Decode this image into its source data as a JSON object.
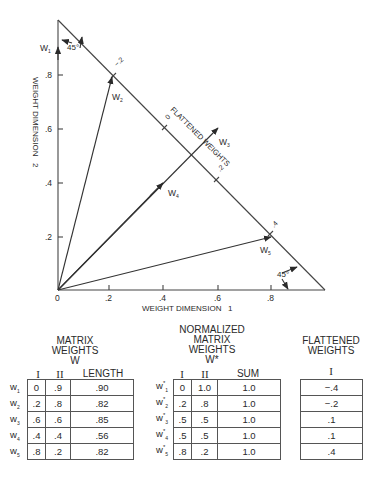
{
  "diagram": {
    "x_axis_label": "WEIGHT DIMENSION   1",
    "y_axis_label": "WEIGHT DIMENSION   2",
    "x_ticks": [
      "0",
      ".2",
      ".4",
      ".6",
      ".8"
    ],
    "y_ticks": [
      ".2",
      ".4",
      ".6",
      ".8"
    ],
    "angle_label_top": "45°",
    "angle_label_bottom": "45°",
    "flattened_axis_label": "FLATTENED WEIGHTS",
    "flattened_ticks": [
      "−.2",
      "0",
      ".2",
      ".4"
    ],
    "vectors": [
      {
        "label": "W",
        "sub": "1",
        "x": 0.0,
        "y": 0.9
      },
      {
        "label": "W",
        "sub": "2",
        "x": 0.2,
        "y": 0.8
      },
      {
        "label": "W",
        "sub": "3",
        "x": 0.6,
        "y": 0.6
      },
      {
        "label": "W",
        "sub": "4",
        "x": 0.4,
        "y": 0.4
      },
      {
        "label": "W",
        "sub": "5",
        "x": 0.8,
        "y": 0.2
      }
    ]
  },
  "matrix_weights": {
    "title_line1": "MATRIX",
    "title_line2": "WEIGHTS",
    "title_line3": "W",
    "columns": [
      "I",
      "II",
      "LENGTH"
    ],
    "rows": [
      {
        "label": "w",
        "sub": "1",
        "values": [
          "0",
          ".9",
          ".90"
        ]
      },
      {
        "label": "w",
        "sub": "2",
        "values": [
          ".2",
          ".8",
          ".82"
        ]
      },
      {
        "label": "w",
        "sub": "3",
        "values": [
          ".6",
          ".6",
          ".85"
        ]
      },
      {
        "label": "w",
        "sub": "4",
        "values": [
          ".4",
          ".4",
          ".56"
        ]
      },
      {
        "label": "w",
        "sub": "5",
        "values": [
          ".8",
          ".2",
          ".82"
        ]
      }
    ]
  },
  "normalized_weights": {
    "title_line1": "NORMALIZED",
    "title_line2": "MATRIX",
    "title_line3": "WEIGHTS",
    "title_line4": "W*",
    "columns": [
      "I",
      "II",
      "SUM"
    ],
    "rows": [
      {
        "label": "w",
        "sup": "*",
        "sub": "1",
        "values": [
          "0",
          "1.0",
          "1.0"
        ]
      },
      {
        "label": "w",
        "sup": "*",
        "sub": "2",
        "values": [
          ".2",
          ".8",
          "1.0"
        ]
      },
      {
        "label": "w",
        "sup": "*",
        "sub": "3",
        "values": [
          ".5",
          ".5",
          "1.0"
        ]
      },
      {
        "label": "w",
        "sup": "*",
        "sub": "4",
        "values": [
          ".5",
          ".5",
          "1.0"
        ]
      },
      {
        "label": "w",
        "sup": "*",
        "sub": "5",
        "values": [
          ".8",
          ".2",
          "1.0"
        ]
      }
    ]
  },
  "flattened_weights": {
    "title_line1": "FLATTENED",
    "title_line2": "WEIGHTS",
    "columns": [
      "I"
    ],
    "rows": [
      "−.4",
      "−.2",
      ".1",
      ".1",
      ".4"
    ]
  }
}
